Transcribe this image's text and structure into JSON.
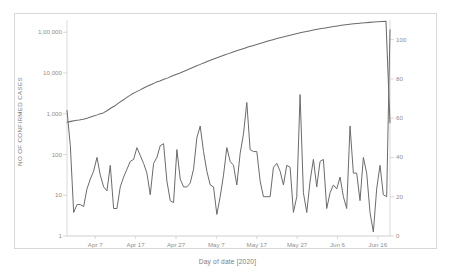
{
  "figure": {
    "background_color": "#ffffff",
    "frame_color": "#d8d8d8",
    "line_color": "#6b6b6b",
    "text_color": "#8a8a8a"
  },
  "chart_data": {
    "type": "line",
    "title": "",
    "subtitle": "",
    "xlabel": "Day of date [2020]",
    "ylabel": "NO OF CONFIRMED CASES",
    "y2label": "NO OF DEPRESSING TWEETS",
    "grid": false,
    "legend": "none",
    "yscale": "log",
    "ylim": [
      1,
      200000
    ],
    "y2lim": [
      0,
      110
    ],
    "y_ticks": [
      1,
      10,
      100,
      1000,
      10000,
      100000
    ],
    "y_tick_labels": [
      "1",
      "10",
      "100",
      "1,000",
      "10,000",
      "1,00,000"
    ],
    "y2_ticks": [
      0,
      20,
      40,
      60,
      80,
      100
    ],
    "y2_tick_labels": [
      "0",
      "20",
      "40",
      "60",
      "80",
      "100"
    ],
    "x_ticks": [
      "Apr 7",
      "Apr 17",
      "Apr 27",
      "May 7",
      "May 17",
      "May 27",
      "Jun 6",
      "Jun 16"
    ],
    "x_tick_positions": [
      7,
      17,
      27,
      37,
      47,
      57,
      67,
      77
    ],
    "x_range": [
      0,
      80
    ],
    "series": [
      {
        "name": "NO OF CONFIRMED CASES",
        "axis": "left",
        "color": "#6b6b6b",
        "values": [
          620,
          650,
          680,
          700,
          730,
          780,
          840,
          900,
          980,
          1050,
          1200,
          1400,
          1600,
          1900,
          2200,
          2600,
          3000,
          3400,
          3800,
          4300,
          4800,
          5300,
          5900,
          6400,
          7000,
          7600,
          8400,
          9200,
          10000,
          11000,
          12200,
          13400,
          14800,
          16300,
          17900,
          19600,
          21400,
          23300,
          25300,
          27500,
          29900,
          32400,
          35000,
          37800,
          40700,
          43800,
          47000,
          50400,
          54000,
          57800,
          61700,
          65800,
          70000,
          74300,
          78800,
          83400,
          88200,
          93200,
          98300,
          103000,
          108000,
          113000,
          118000,
          123000,
          128000,
          133000,
          138000,
          143000,
          148000,
          153000,
          157000,
          161000,
          165000,
          169000,
          172000,
          175000,
          178000,
          181000,
          184000,
          186000,
          600
        ]
      },
      {
        "name": "NO OF DEPRESSING TWEETS",
        "axis": "right",
        "color": "#6b6b6b",
        "values": [
          64,
          46,
          12,
          16,
          16,
          15,
          24,
          29,
          33,
          40,
          31,
          25,
          23,
          36,
          14,
          14,
          25,
          30,
          34,
          38,
          39,
          45,
          41,
          37,
          32,
          21,
          37,
          40,
          46,
          47,
          28,
          18,
          17,
          44,
          29,
          25,
          25,
          27,
          34,
          50,
          56,
          43,
          33,
          26,
          25,
          11,
          20,
          31,
          45,
          38,
          36,
          26,
          42,
          52,
          68,
          44,
          43,
          43,
          28,
          20,
          20,
          20,
          35,
          37,
          33,
          26,
          36,
          35,
          12,
          20,
          72,
          22,
          12,
          28,
          39,
          25,
          38,
          39,
          14,
          22,
          26,
          24,
          30,
          20,
          14,
          56,
          32,
          32,
          18,
          40,
          32,
          12,
          2,
          24,
          36,
          21,
          20,
          105
        ]
      }
    ]
  }
}
